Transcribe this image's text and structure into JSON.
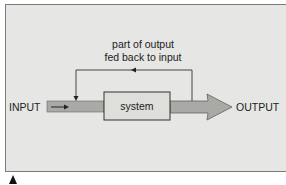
{
  "diagram": {
    "input_label": "INPUT",
    "system_label": "system",
    "output_label": "OUTPUT",
    "feedback_caption_line1": "part of output",
    "feedback_caption_line2": "fed back to input"
  },
  "colors": {
    "panel_bg": "#e6e6e4",
    "flow_band": "#a9a9a6",
    "system_box": "#dededb",
    "line": "#333333"
  }
}
